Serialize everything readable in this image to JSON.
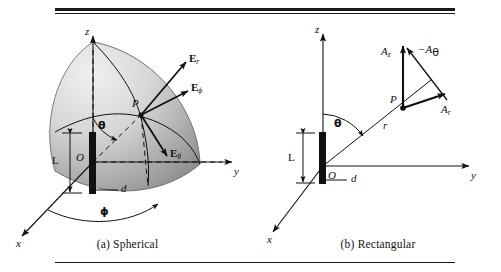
{
  "figure": {
    "panels": [
      {
        "id": "spherical",
        "caption": "(a)  Spherical",
        "axes": {
          "x": "x",
          "y": "y",
          "z": "z"
        },
        "point": "P",
        "origin": "O",
        "dipole_length": "L",
        "dipole_offset": "d",
        "angles": {
          "theta": "θ",
          "phi": "ϕ"
        },
        "vectors": [
          {
            "name": "E-r",
            "base": "E",
            "subscript": "r"
          },
          {
            "name": "E-phi",
            "base": "E",
            "subscript": "ϕ"
          },
          {
            "name": "E-theta",
            "base": "E",
            "subscript": "θ"
          }
        ]
      },
      {
        "id": "rectangular",
        "caption": "(b)  Rectangular",
        "axes": {
          "x": "x",
          "y": "y",
          "z": "z"
        },
        "point": "P",
        "origin": "O",
        "dipole_length": "L",
        "dipole_offset": "d",
        "radial_label": "r",
        "angles": {
          "theta": "θ"
        },
        "vectors": [
          {
            "name": "A-z",
            "base": "A",
            "subscript": "z"
          },
          {
            "name": "A-theta-minus",
            "base": "−A",
            "subscript": "θ"
          },
          {
            "name": "A-r",
            "base": "A",
            "subscript": "r"
          }
        ]
      }
    ],
    "colors": {
      "ink": "#111111",
      "rule": "#1a1a1a",
      "shell_light": "#e8e8e8",
      "shell_mid": "#c2c2c2",
      "shell_dark": "#8f8f8f"
    }
  }
}
